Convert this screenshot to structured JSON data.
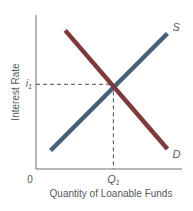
{
  "chart_data": {
    "type": "line",
    "title": "",
    "xlabel": "Quantity of Loanable Funds",
    "ylabel": "Interest Rate",
    "origin_label": "0",
    "xlim": [
      0,
      10
    ],
    "ylim": [
      0,
      10
    ],
    "grid": false,
    "legend": "none",
    "series": [
      {
        "name": "S",
        "label": "S",
        "color": "#46607a",
        "points": [
          [
            1,
            1.2
          ],
          [
            9,
            8.8
          ]
        ]
      },
      {
        "name": "D",
        "label": "D",
        "color": "#7d3a3a",
        "points": [
          [
            2,
            9.0
          ],
          [
            9,
            1.3
          ]
        ]
      }
    ],
    "equilibrium": {
      "x": 5.3,
      "y": 5.5,
      "x_label": "Q",
      "x_label_sub": "1",
      "y_label": "i",
      "y_label_sub": "1",
      "guide_style": "dashed"
    }
  }
}
